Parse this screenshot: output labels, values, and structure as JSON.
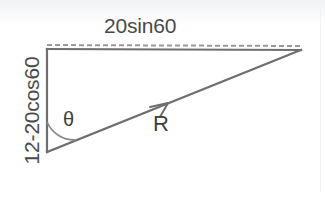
{
  "figure": {
    "type": "vector-triangle-diagram",
    "title_text": null,
    "background_color": "#ffffff",
    "stroke_color": "#6e6e6e",
    "dashed_color": "#9a9a9a",
    "text_color": "#4a4a4a",
    "labels": {
      "top_side": "20sin60",
      "left_side": "12-20cos60",
      "angle": "θ",
      "resultant": "R"
    },
    "geometry": {
      "vertex_top_left": [
        47,
        49
      ],
      "vertex_bottom_left": [
        47,
        152
      ],
      "vertex_right": [
        301,
        50
      ],
      "arrow_tip": [
        168,
        103
      ],
      "angle_arc_radius": 30
    }
  }
}
